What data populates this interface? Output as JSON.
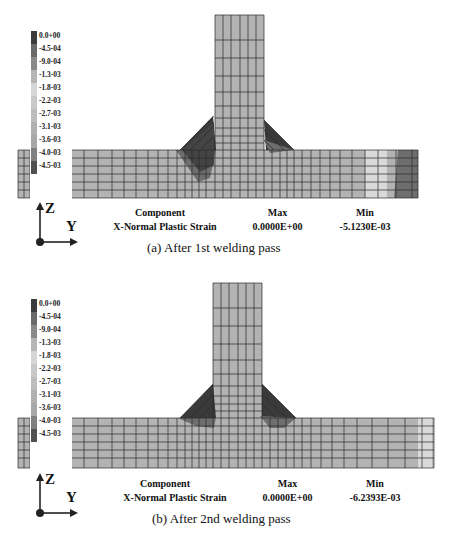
{
  "legend": {
    "labels": [
      "0.0+00",
      "-4.5-04",
      "-9.0-04",
      "-1.3-03",
      "-1.8-03",
      "-2.2-03",
      "-2.7-03",
      "-3.1-03",
      "-3.6-03",
      "-4.0-03",
      "-4.5-03"
    ],
    "colors": [
      "#3c3c3c",
      "#6a6a6a",
      "#8a8a8a",
      "#b5b5b5",
      "#d6d6d6",
      "#c8c8c8",
      "#bdbdbd",
      "#b0b0b0",
      "#a8a8a8",
      "#808080",
      "#505050"
    ]
  },
  "axes": {
    "vertical": "Z",
    "horizontal": "Y"
  },
  "panels": [
    {
      "component_header": "Component",
      "component_value": "X-Normal Plastic Strain",
      "max_header": "Max",
      "max_value": "0.0000E+00",
      "min_header": "Min",
      "min_value": "-5.1230E-03",
      "caption": "(a) After 1st welding pass"
    },
    {
      "component_header": "Component",
      "component_value": "X-Normal Plastic Strain",
      "max_header": "Max",
      "max_value": "0.0000E+00",
      "min_header": "Min",
      "min_value": "-6.2393E-03",
      "caption": "(b) After 2nd welding pass"
    }
  ],
  "colors": {
    "mesh_fill": "#b3b3b3",
    "mesh_line": "#2a2a2a",
    "weld_dark": "#3a3a3a",
    "weld_mid": "#6e6e6e",
    "light_band": "#d9d9d9"
  }
}
